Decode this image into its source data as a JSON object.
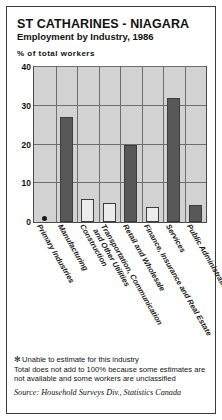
{
  "header": {
    "title": "ST CATHARINES - NIAGARA",
    "subtitle": "Employment by Industry, 1986",
    "axis_note": "% of total workers"
  },
  "footnotes": {
    "star_symbol": "✻",
    "star_note": "Unable to estimate for this industry",
    "line2": "Total does not add to 100% because some estimates are",
    "line3": "not available and some workers are unclassified",
    "source": "Source: Household Surveys Div., Statistics Canada"
  },
  "colors": {
    "plot_background": "#d2d2d2",
    "bar_dark": "#585858",
    "bar_light": "#ececec",
    "grid": "#6e6e6e",
    "frame": "#3a3a3a",
    "text": "#111111"
  },
  "chart_data": {
    "type": "bar",
    "title": "ST CATHARINES - NIAGARA",
    "subtitle": "Employment by Industry, 1986",
    "xlabel": "",
    "ylabel": "% of total workers",
    "ylim": [
      0,
      40
    ],
    "yticks": [
      0,
      10,
      20,
      30,
      40
    ],
    "grid": true,
    "legend": "none",
    "categories": [
      "Primary Industries",
      "Manufacturing",
      "Construction",
      "Transportation, Communication and Other Utilities",
      "Retail and Wholesale",
      "Finance, Insurance and Real Estate",
      "Services",
      "Public Administration"
    ],
    "category_lines": [
      [
        "Primary Industries"
      ],
      [
        "Manufacturing"
      ],
      [
        "Construction"
      ],
      [
        "Transportation, Communication",
        "and Other Utilities"
      ],
      [
        "Retail and Wholesale"
      ],
      [
        "Finance, Insurance and Real Estate"
      ],
      [
        "Services"
      ],
      [
        "Public Administration"
      ]
    ],
    "values": [
      null,
      27,
      6,
      5,
      20,
      4,
      32,
      4.5
    ],
    "bar_shades": [
      "none",
      "dark",
      "light",
      "light",
      "dark",
      "light",
      "dark",
      "dark"
    ],
    "annotations": [
      {
        "category": "Primary Industries",
        "marker": "asterisk",
        "note": "Unable to estimate for this industry"
      }
    ]
  }
}
